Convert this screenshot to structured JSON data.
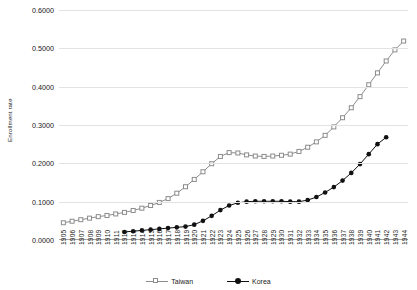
{
  "chart_data": {
    "type": "line",
    "title": "",
    "xlabel": "",
    "ylabel": "Enrollment rate",
    "ylim": [
      0.0,
      0.6
    ],
    "ytick_labels": [
      "0.0000",
      "0.1000",
      "0.2000",
      "0.3000",
      "0.4000",
      "0.5000",
      "0.6000"
    ],
    "ytick_values": [
      0.0,
      0.1,
      0.2,
      0.3,
      0.4,
      0.5,
      0.6
    ],
    "grid": true,
    "legend_position": "bottom",
    "x": [
      1905,
      1906,
      1907,
      1908,
      1909,
      1910,
      1911,
      1912,
      1913,
      1914,
      1915,
      1916,
      1917,
      1918,
      1919,
      1920,
      1921,
      1922,
      1923,
      1924,
      1925,
      1926,
      1927,
      1928,
      1929,
      1930,
      1931,
      1932,
      1933,
      1934,
      1935,
      1936,
      1937,
      1938,
      1939,
      1940,
      1941,
      1942,
      1943,
      1944
    ],
    "categories": [
      "1905",
      "1906",
      "1907",
      "1908",
      "1909",
      "1910",
      "1911",
      "1912",
      "1913",
      "1914",
      "1915",
      "1916",
      "1917",
      "1918",
      "1919",
      "1920",
      "1921",
      "1922",
      "1923",
      "1924",
      "1925",
      "1926",
      "1927",
      "1928",
      "1929",
      "1930",
      "1931",
      "1932",
      "1933",
      "1934",
      "1935",
      "1936",
      "1937",
      "1938",
      "1939",
      "1940",
      "1941",
      "1942",
      "1943",
      "1944"
    ],
    "series": [
      {
        "name": "Taiwan",
        "color": "#8c8c8c",
        "marker": "open-square",
        "x": [
          1905,
          1906,
          1907,
          1908,
          1909,
          1910,
          1911,
          1912,
          1913,
          1914,
          1915,
          1916,
          1917,
          1918,
          1919,
          1920,
          1921,
          1922,
          1923,
          1924,
          1925,
          1926,
          1927,
          1928,
          1929,
          1930,
          1931,
          1932,
          1933,
          1934,
          1935,
          1936,
          1937,
          1938,
          1939,
          1940,
          1941,
          1942,
          1943,
          1944
        ],
        "values": [
          0.045,
          0.049,
          0.053,
          0.057,
          0.061,
          0.064,
          0.068,
          0.072,
          0.077,
          0.083,
          0.09,
          0.098,
          0.108,
          0.122,
          0.139,
          0.158,
          0.178,
          0.199,
          0.218,
          0.228,
          0.227,
          0.222,
          0.219,
          0.218,
          0.219,
          0.221,
          0.224,
          0.231,
          0.242,
          0.256,
          0.273,
          0.295,
          0.319,
          0.345,
          0.374,
          0.405,
          0.436,
          0.467,
          0.496,
          0.519
        ]
      },
      {
        "name": "Korea",
        "color": "#111111",
        "marker": "filled-circle",
        "x": [
          1912,
          1913,
          1914,
          1915,
          1916,
          1917,
          1918,
          1919,
          1920,
          1921,
          1922,
          1923,
          1924,
          1925,
          1926,
          1927,
          1928,
          1929,
          1930,
          1931,
          1932,
          1933,
          1934,
          1935,
          1936,
          1937,
          1938,
          1939,
          1940,
          1941,
          1942
        ],
        "values": [
          0.021,
          0.023,
          0.025,
          0.027,
          0.029,
          0.031,
          0.033,
          0.035,
          0.04,
          0.05,
          0.063,
          0.078,
          0.09,
          0.097,
          0.1,
          0.101,
          0.101,
          0.101,
          0.101,
          0.1,
          0.1,
          0.104,
          0.112,
          0.124,
          0.138,
          0.155,
          0.175,
          0.198,
          0.224,
          0.25,
          0.268
        ]
      }
    ]
  },
  "legend": {
    "items": [
      {
        "label": "Taiwan",
        "marker": "open-square",
        "color": "#8c8c8c"
      },
      {
        "label": "Korea",
        "marker": "filled-circle",
        "color": "#111111"
      }
    ]
  }
}
